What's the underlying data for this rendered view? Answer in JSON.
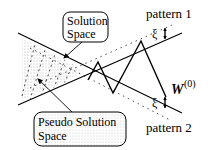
{
  "diagram": {
    "labels": {
      "solution_space": [
        "Solution",
        "Space"
      ],
      "pseudo_solution_space": [
        "Pseudo Solution",
        "Space"
      ],
      "pattern1": "pattern 1",
      "pattern2": "pattern 2",
      "xi1": "ξ",
      "xi2": "ξ",
      "weight_base": "W",
      "weight_sup": "(0)"
    },
    "colors": {
      "line": "#000000",
      "stipple": "#555555",
      "background": "#ffffff"
    }
  }
}
